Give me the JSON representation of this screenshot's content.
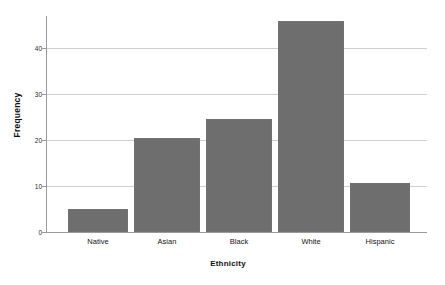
{
  "chart_data": {
    "type": "bar",
    "title": "",
    "subtitle": "",
    "xlabel": "Ethnicity",
    "ylabel": "Frequency",
    "categories": [
      "Native",
      "Asian",
      "Black",
      "White",
      "Hispanic"
    ],
    "values": [
      5,
      20,
      24,
      45,
      10.5
    ],
    "series": [
      {
        "name": "Frequency",
        "values": [
          5,
          20,
          24,
          45,
          10.5
        ]
      }
    ],
    "ylim": [
      0,
      46
    ],
    "yticks": [
      0,
      10,
      20,
      30,
      40
    ],
    "ytick_labels": [
      "0",
      "10",
      "20",
      "30",
      "40"
    ],
    "xlim_categories": 5,
    "grid": "horizontal",
    "legend": "none",
    "bar_color": "#6e6e6e",
    "background_color": "#ffffff",
    "gridline_color": "#cfcfcf",
    "axis_color": "#9a9a9a"
  }
}
